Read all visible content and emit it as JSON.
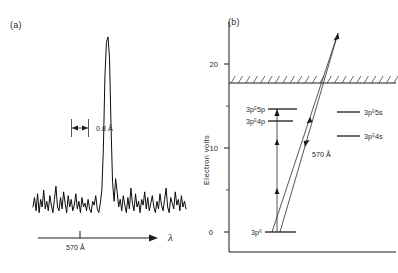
{
  "figure": {
    "panels": [
      {
        "id": "a",
        "label": "(a)"
      },
      {
        "id": "b",
        "label": "(b)"
      }
    ]
  },
  "panel_a": {
    "label": "(a)",
    "linewidth_annotation": "0.8 Å",
    "x_tick_label": "570 Å",
    "x_axis_symbol": "λ"
  },
  "panel_b": {
    "label": "(b)",
    "y_axis_title": "Electron volts",
    "y_ticks": [
      "0",
      "10",
      "20"
    ],
    "y_minor_ticks": [
      "5",
      "15"
    ],
    "transition_label": "570 Å",
    "levels": [
      {
        "name": "ground",
        "label": "3p⁶",
        "side": "left"
      },
      {
        "name": "3p5-4p",
        "label": "3p⁵4p",
        "side": "left"
      },
      {
        "name": "3p5-5p",
        "label": "3p⁵5p",
        "side": "left"
      },
      {
        "name": "3p5-4s",
        "label": "3p⁵4s",
        "side": "right"
      },
      {
        "name": "3p5-5s",
        "label": "3p⁵5s",
        "side": "right"
      }
    ]
  },
  "chart_data": [
    {
      "type": "line",
      "name": "panel-a-spectrum",
      "title": "",
      "xlabel": "λ",
      "ylabel": "",
      "xlim": [
        0,
        100
      ],
      "ylim": [
        0,
        100
      ],
      "grid": false,
      "annotations": [
        {
          "text": "0.8 Å",
          "x": 52,
          "y": 52,
          "kind": "linewidth-arrow"
        },
        {
          "text": "570 Å",
          "x": 47,
          "y": -10,
          "kind": "x-tick"
        }
      ],
      "x": [
        0,
        1,
        2,
        3,
        4,
        5,
        6,
        7,
        8,
        9,
        10,
        11,
        12,
        13,
        14,
        15,
        16,
        17,
        18,
        19,
        20,
        21,
        22,
        23,
        24,
        25,
        26,
        27,
        28,
        29,
        30,
        31,
        32,
        33,
        34,
        35,
        36,
        37,
        38,
        39,
        40,
        41,
        42,
        43,
        44,
        45,
        46,
        47,
        48,
        49,
        50,
        51,
        52,
        53,
        54,
        55,
        56,
        57,
        58,
        59,
        60,
        61,
        62,
        63,
        64,
        65,
        66,
        67,
        68,
        69,
        70,
        71,
        72,
        73,
        74,
        75,
        76,
        77,
        78,
        79,
        80,
        81,
        82,
        83,
        84,
        85,
        86,
        87,
        88,
        89,
        90,
        91,
        92,
        93,
        94,
        95,
        96,
        97,
        98,
        99,
        100
      ],
      "values": [
        9,
        14,
        7,
        16,
        6,
        13,
        9,
        18,
        8,
        12,
        7,
        15,
        10,
        6,
        13,
        20,
        9,
        7,
        14,
        8,
        17,
        11,
        6,
        15,
        9,
        13,
        7,
        10,
        16,
        8,
        12,
        6,
        14,
        9,
        11,
        7,
        13,
        8,
        6,
        12,
        10,
        15,
        8,
        6,
        11,
        18,
        40,
        78,
        96,
        99,
        88,
        52,
        22,
        12,
        24,
        17,
        9,
        13,
        7,
        15,
        10,
        6,
        14,
        8,
        19,
        11,
        7,
        16,
        9,
        12,
        6,
        13,
        10,
        17,
        8,
        14,
        7,
        11,
        15,
        9,
        6,
        12,
        8,
        16,
        10,
        7,
        13,
        19,
        9,
        6,
        14,
        11,
        8,
        17,
        10,
        13,
        7,
        15,
        9,
        12,
        8
      ]
    },
    {
      "type": "scatter",
      "name": "panel-b-energy-levels",
      "title": "",
      "xlabel": "",
      "ylabel": "Electron volts",
      "ylim": [
        0,
        23
      ],
      "grid": false,
      "ionization_limit_ev": 15.8,
      "levels_ev": [
        {
          "label": "3p⁶",
          "energy": 0,
          "side": "left"
        },
        {
          "label": "3p⁵4p",
          "energy": 13.2,
          "side": "left"
        },
        {
          "label": "3p⁵5p",
          "energy": 14.6,
          "side": "left"
        },
        {
          "label": "3p⁵4s",
          "energy": 11.6,
          "side": "right"
        },
        {
          "label": "3p⁵5s",
          "energy": 14.1,
          "side": "right"
        }
      ],
      "transitions": [
        {
          "label": "",
          "from_ev": 0,
          "to_ev": 22.0,
          "kind": "excitation"
        },
        {
          "label": "570 Å",
          "from_ev": 22.0,
          "to_ev": 0,
          "kind": "emission"
        }
      ]
    }
  ]
}
